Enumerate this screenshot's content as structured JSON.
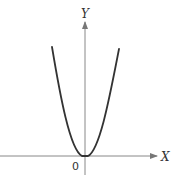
{
  "diagram": {
    "title": "",
    "curve": "y = x^2 (parabola through origin)",
    "axes": {
      "x_label": "X",
      "y_label": "Y",
      "origin_label": "0"
    },
    "colors": {
      "curve": "#333333",
      "axis": "#777777",
      "text": "#333333"
    }
  }
}
